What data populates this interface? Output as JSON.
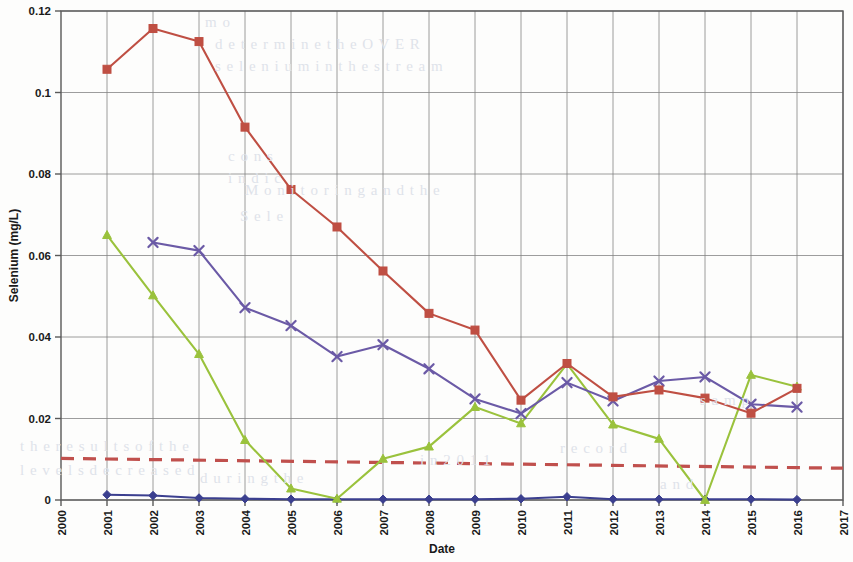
{
  "figure": {
    "background_color": "#fdfdfc",
    "plot_area": {
      "left": 61,
      "top": 11,
      "right": 843,
      "bottom": 500
    }
  },
  "axes": {
    "y": {
      "label": "Selenium (mg/L)",
      "ticks": [
        "0",
        "0.02",
        "0.04",
        "0.06",
        "0.08",
        "0.1",
        "0.12"
      ],
      "min": 0,
      "max": 0.12,
      "step": 0.02
    },
    "x": {
      "label": "Date",
      "ticks": [
        "2000",
        "2001",
        "2002",
        "2003",
        "2004",
        "2005",
        "2006",
        "2007",
        "2008",
        "2009",
        "2010",
        "2011",
        "2012",
        "2013",
        "2014",
        "2015",
        "2016",
        "2017"
      ],
      "min": 2000,
      "max": 2017,
      "step": 1,
      "tick_rotation": -90
    }
  },
  "colors": {
    "series_red": "#bf4f43",
    "series_purple": "#6b5aa6",
    "series_green": "#9ac23c",
    "series_blue": "#3b3f8f",
    "trend_dashed": "#c0504d",
    "grid": "#808080",
    "axis": "#595959",
    "text": "#1a1a1a"
  },
  "bleed_text": [
    {
      "text": "m o",
      "x": 205,
      "y": 14
    },
    {
      "text": "d e t e r m i n e   t h e   O V E R",
      "x": 215,
      "y": 36
    },
    {
      "text": "s e l e n i u m   i n   t h e   s t r e a m",
      "x": 215,
      "y": 58
    },
    {
      "text": "c o n s",
      "x": 228,
      "y": 148
    },
    {
      "text": "i n d i c",
      "x": 228,
      "y": 170
    },
    {
      "text": "S e l e",
      "x": 240,
      "y": 208
    },
    {
      "text": "M o n i t o r i n g   a n d   t h e",
      "x": 245,
      "y": 182
    },
    {
      "text": "t h e   r e s u l t s   o f   t h e",
      "x": 20,
      "y": 438
    },
    {
      "text": "l e v e l s   d e c r e a s e d",
      "x": 20,
      "y": 462
    },
    {
      "text": "d u r i n g   t h e",
      "x": 200,
      "y": 470
    },
    {
      "text": "i n   2 0 1 1",
      "x": 420,
      "y": 452
    },
    {
      "text": "r e c o r d",
      "x": 560,
      "y": 440
    },
    {
      "text": "a n d",
      "x": 660,
      "y": 476
    },
    {
      "text": "s a m p",
      "x": 700,
      "y": 392
    }
  ],
  "chart_data": {
    "type": "line",
    "title": "",
    "xlabel": "Date",
    "ylabel": "Selenium (mg/L)",
    "xlim": [
      2000,
      2017
    ],
    "ylim": [
      0,
      0.12
    ],
    "grid": true,
    "legend": "none",
    "x": [
      2001,
      2002,
      2003,
      2004,
      2005,
      2006,
      2007,
      2008,
      2009,
      2010,
      2011,
      2012,
      2013,
      2014,
      2015,
      2016
    ],
    "series": [
      {
        "name": "series-red",
        "color": "#bf4f43",
        "marker": "square",
        "line_style": "solid",
        "x": [
          2001,
          2002,
          2003,
          2004,
          2005,
          2006,
          2007,
          2008,
          2009,
          2010,
          2011,
          2012,
          2013,
          2014,
          2015,
          2016
        ],
        "values": [
          0.1057,
          0.1157,
          0.1125,
          0.0915,
          0.0762,
          0.067,
          0.0562,
          0.0458,
          0.0417,
          0.0245,
          0.0335,
          0.0253,
          0.027,
          0.025,
          0.0213,
          0.0274
        ]
      },
      {
        "name": "series-purple",
        "color": "#6b5aa6",
        "marker": "cross",
        "line_style": "solid",
        "x": [
          2002,
          2003,
          2004,
          2005,
          2006,
          2007,
          2008,
          2009,
          2010,
          2011,
          2012,
          2013,
          2014,
          2015,
          2016
        ],
        "values": [
          0.0632,
          0.0612,
          0.0472,
          0.0428,
          0.0352,
          0.0381,
          0.0322,
          0.0248,
          0.0212,
          0.0288,
          0.0243,
          0.0292,
          0.0302,
          0.0235,
          0.0228
        ]
      },
      {
        "name": "series-green",
        "color": "#9ac23c",
        "marker": "triangle",
        "line_style": "solid",
        "x": [
          2001,
          2002,
          2003,
          2004,
          2005,
          2006,
          2007,
          2008,
          2009,
          2010,
          2011,
          2012,
          2013,
          2014,
          2015,
          2016
        ],
        "values": [
          0.065,
          0.0502,
          0.0358,
          0.0147,
          0.0028,
          0.0003,
          0.0101,
          0.0131,
          0.0228,
          0.0188,
          0.0334,
          0.0185,
          0.015,
          0.0,
          0.0307,
          0.0278
        ]
      },
      {
        "name": "series-blue",
        "color": "#3b3f8f",
        "marker": "diamond",
        "line_style": "solid",
        "x": [
          2001,
          2002,
          2003,
          2004,
          2005,
          2006,
          2007,
          2008,
          2009,
          2010,
          2011,
          2012,
          2013,
          2014,
          2015,
          2016
        ],
        "values": [
          0.0013,
          0.0011,
          0.0005,
          0.0003,
          0.0002,
          0.0002,
          0.0002,
          0.0002,
          0.0002,
          0.0003,
          0.0008,
          0.0002,
          0.0002,
          0.0002,
          0.0002,
          0.0001
        ]
      }
    ],
    "trend_line": {
      "name": "trend-dashed",
      "color": "#c0504d",
      "line_style": "dashed",
      "x_start": 2000,
      "x_end": 2017,
      "y_start": 0.0102,
      "y_end": 0.0078
    }
  }
}
